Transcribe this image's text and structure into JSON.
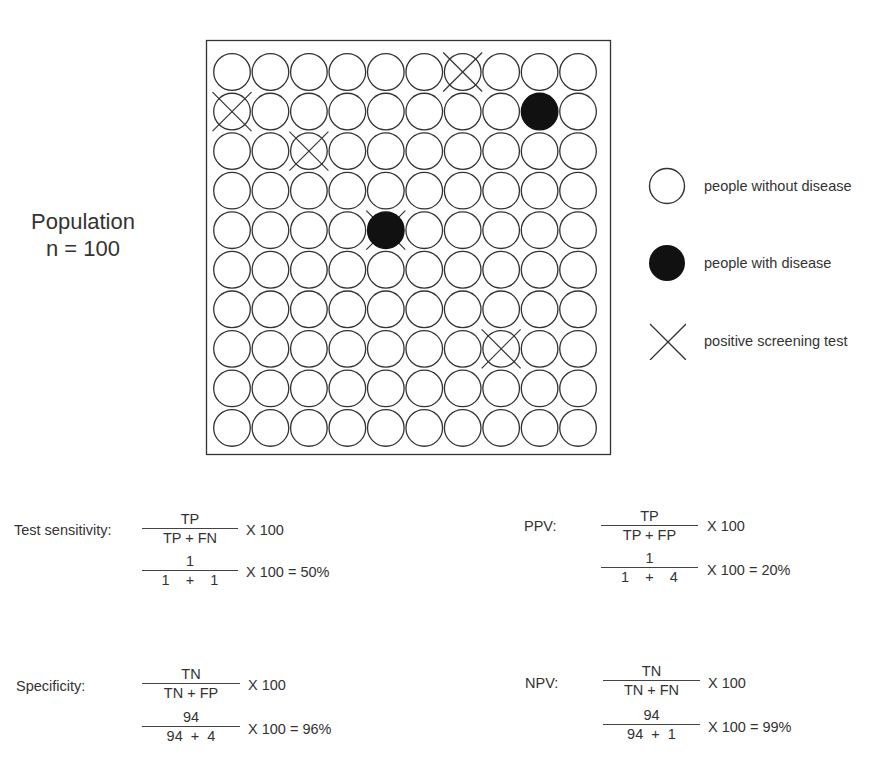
{
  "population": {
    "label": "Population",
    "n_label": "n = 100",
    "rows": 10,
    "cols": 10,
    "diseased": [
      [
        1,
        8
      ],
      [
        4,
        4
      ]
    ],
    "positive_test": [
      [
        0,
        6
      ],
      [
        1,
        0
      ],
      [
        2,
        2
      ],
      [
        4,
        4
      ],
      [
        7,
        7
      ]
    ]
  },
  "legend": {
    "items": [
      {
        "icon": "open-circle-icon",
        "label": "people without disease"
      },
      {
        "icon": "filled-circle-icon",
        "label": "people with disease"
      },
      {
        "icon": "x-mark-icon",
        "label": "positive screening test"
      }
    ]
  },
  "formulas": {
    "sensitivity": {
      "label": "Test sensitivity:",
      "num1": "TP",
      "den1": "TP + FN",
      "mult1": "X 100",
      "num2": "1",
      "den2": "1    +    1",
      "mult2": "X 100 = 50%"
    },
    "ppv": {
      "label": "PPV:",
      "num1": "TP",
      "den1": "TP + FP",
      "mult1": "X 100",
      "num2": "1",
      "den2": "1    +    4",
      "mult2": "X 100 = 20%"
    },
    "specificity": {
      "label": "Specificity:",
      "num1": "TN",
      "den1": "TN + FP",
      "mult1": "X 100",
      "num2": "94",
      "den2": "94  +  4",
      "mult2": "X 100 = 96%"
    },
    "npv": {
      "label": "NPV:",
      "num1": "TN",
      "den1": "TN + FN",
      "mult1": "X 100",
      "num2": "94",
      "den2": "94  +  1",
      "mult2": "X 100 = 99%"
    }
  },
  "colors": {
    "stroke": "#333333",
    "fill_disease": "#111111",
    "background": "#ffffff"
  }
}
